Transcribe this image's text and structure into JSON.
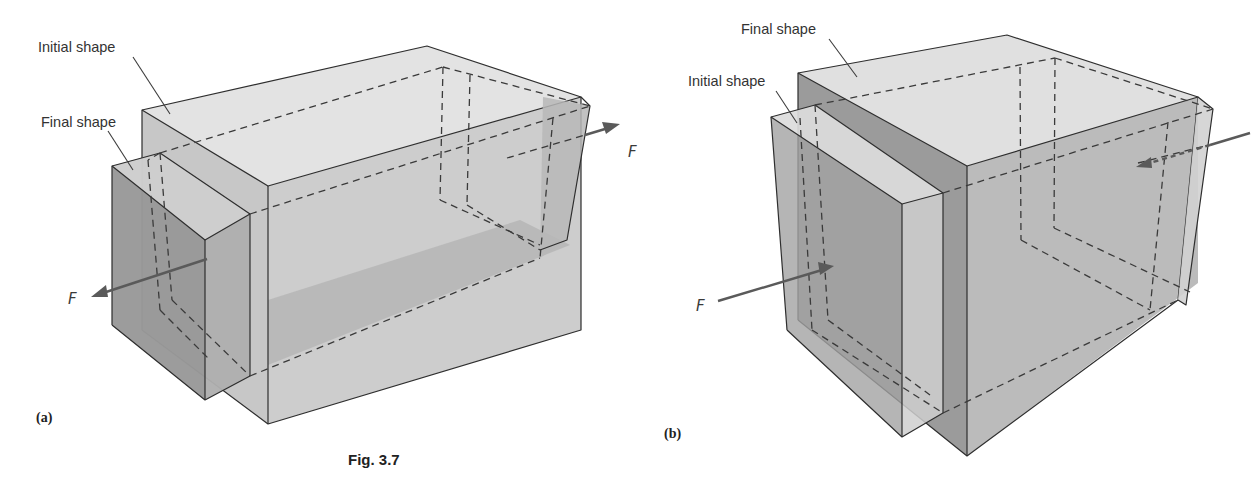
{
  "figure": {
    "caption": "Fig. 3.7",
    "colors": {
      "light_face": "#dcdcdc",
      "mid_face": "#b9b9b9",
      "dark_face": "#8f8f8f",
      "edge": "#2e2e2e",
      "arrow": "#5a5a5a"
    }
  },
  "panel_a": {
    "panel_label": "(a)",
    "label_initial": "Initial shape",
    "label_final": "Final shape",
    "force_left": "F",
    "force_right": "F"
  },
  "panel_b": {
    "panel_label": "(b)",
    "label_final": "Final shape",
    "label_initial": "Initial shape",
    "force_left": "F"
  }
}
